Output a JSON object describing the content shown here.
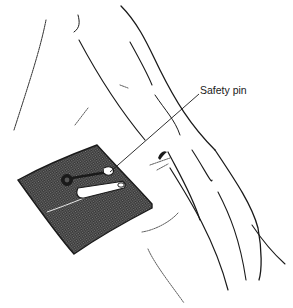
{
  "figure": {
    "labels": [
      {
        "text": "Safety pin",
        "target": "safety-pin"
      }
    ]
  },
  "colors": {
    "ink": "#1a1a1a",
    "background": "#ffffff",
    "gauze": "#3a3a3a"
  }
}
